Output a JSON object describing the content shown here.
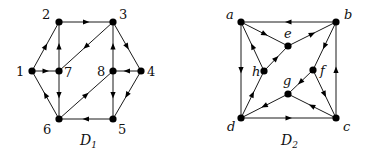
{
  "diagrams": [
    {
      "id": "D1",
      "caption": "D",
      "caption_sub": "1",
      "caption_pos": [
        80,
        145
      ],
      "italic_labels": false,
      "nodes": [
        {
          "id": "1",
          "x": 32,
          "y": 71,
          "lx": 16,
          "ly": 76
        },
        {
          "id": "2",
          "x": 59,
          "y": 22,
          "lx": 42,
          "ly": 19
        },
        {
          "id": "3",
          "x": 113,
          "y": 22,
          "lx": 119,
          "ly": 19
        },
        {
          "id": "4",
          "x": 141,
          "y": 71,
          "lx": 147,
          "ly": 76
        },
        {
          "id": "5",
          "x": 113,
          "y": 119,
          "lx": 118,
          "ly": 134
        },
        {
          "id": "6",
          "x": 59,
          "y": 119,
          "lx": 43,
          "ly": 134
        },
        {
          "id": "7",
          "x": 59,
          "y": 71,
          "lx": 64,
          "ly": 77
        },
        {
          "id": "8",
          "x": 113,
          "y": 71,
          "lx": 97,
          "ly": 76
        }
      ],
      "edges": [
        {
          "from": "1",
          "to": "2"
        },
        {
          "from": "2",
          "to": "3"
        },
        {
          "from": "3",
          "to": "4"
        },
        {
          "from": "4",
          "to": "8"
        },
        {
          "from": "4",
          "to": "5"
        },
        {
          "from": "5",
          "to": "6"
        },
        {
          "from": "6",
          "to": "1"
        },
        {
          "from": "1",
          "to": "7"
        },
        {
          "from": "7",
          "to": "2"
        },
        {
          "from": "7",
          "to": "6"
        },
        {
          "from": "3",
          "to": "7"
        },
        {
          "from": "8",
          "to": "3"
        },
        {
          "from": "8",
          "to": "5"
        },
        {
          "from": "6",
          "to": "8"
        }
      ]
    },
    {
      "id": "D2",
      "caption": "D",
      "caption_sub": "2",
      "caption_pos": [
        281,
        145
      ],
      "italic_labels": true,
      "nodes": [
        {
          "id": "a",
          "x": 241,
          "y": 22,
          "lx": 226,
          "ly": 19
        },
        {
          "id": "b",
          "x": 336,
          "y": 22,
          "lx": 344,
          "ly": 19
        },
        {
          "id": "c",
          "x": 336,
          "y": 118,
          "lx": 343,
          "ly": 131
        },
        {
          "id": "d",
          "x": 241,
          "y": 118,
          "lx": 227,
          "ly": 131
        },
        {
          "id": "e",
          "x": 288,
          "y": 46,
          "lx": 284,
          "ly": 38
        },
        {
          "id": "f",
          "x": 313,
          "y": 70,
          "lx": 320,
          "ly": 75
        },
        {
          "id": "g",
          "x": 288,
          "y": 94,
          "lx": 283,
          "ly": 85
        },
        {
          "id": "h",
          "x": 264,
          "y": 71,
          "lx": 252,
          "ly": 76
        }
      ],
      "edges": [
        {
          "from": "b",
          "to": "a"
        },
        {
          "from": "a",
          "to": "d"
        },
        {
          "from": "d",
          "to": "c"
        },
        {
          "from": "c",
          "to": "b"
        },
        {
          "from": "a",
          "to": "e"
        },
        {
          "from": "e",
          "to": "b"
        },
        {
          "from": "h",
          "to": "a"
        },
        {
          "from": "h",
          "to": "e"
        },
        {
          "from": "d",
          "to": "h"
        },
        {
          "from": "b",
          "to": "f"
        },
        {
          "from": "f",
          "to": "g"
        },
        {
          "from": "f",
          "to": "c"
        },
        {
          "from": "c",
          "to": "g"
        },
        {
          "from": "g",
          "to": "d"
        }
      ]
    }
  ]
}
